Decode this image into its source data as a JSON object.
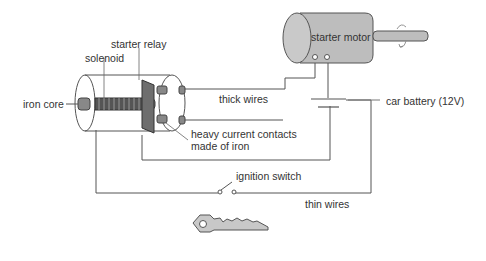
{
  "diagram": {
    "type": "circuit-illustration",
    "labels": {
      "starter_relay": "starter relay",
      "solenoid": "solenoid",
      "iron_core": "iron core",
      "thick_wires": "thick wires",
      "heavy_contacts_line1": "heavy current contacts",
      "heavy_contacts_line2": "made of iron",
      "starter_motor": "starter motor",
      "car_battery": "car battery (12V)",
      "ignition_switch": "ignition switch",
      "thin_wires": "thin wires"
    },
    "components": [
      {
        "id": "starter-relay",
        "shape": "cylinder"
      },
      {
        "id": "solenoid",
        "shape": "coil"
      },
      {
        "id": "iron-core",
        "shape": "rod"
      },
      {
        "id": "heavy-current-contacts",
        "shape": "plate-and-studs"
      },
      {
        "id": "starter-motor",
        "shape": "cylinder-with-shaft"
      },
      {
        "id": "car-battery",
        "shape": "cell-symbol"
      },
      {
        "id": "ignition-switch",
        "shape": "open-switch"
      },
      {
        "id": "ignition-key",
        "shape": "key"
      }
    ],
    "colors": {
      "line": "#555555",
      "motor_fill": "#bdbdbd",
      "plate_fill": "#6e6e6e",
      "key_fill": "#c8c8c8",
      "text": "#333333"
    }
  }
}
